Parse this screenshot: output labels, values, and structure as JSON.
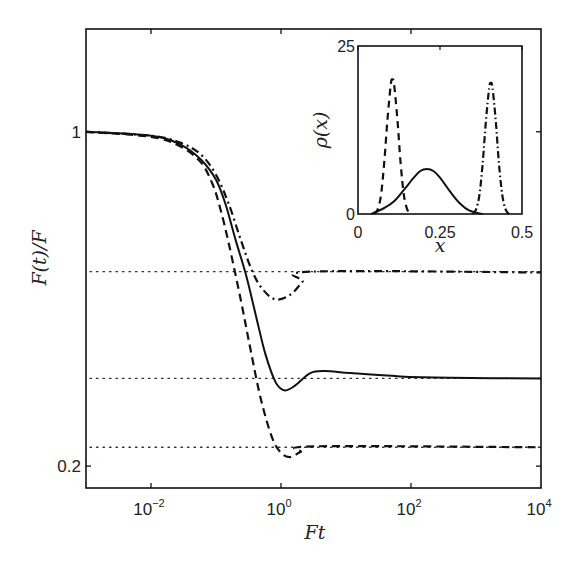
{
  "chart_data": [
    {
      "type": "line",
      "panel": "main",
      "title": "",
      "xlabel": "Ft",
      "ylabel": "F(t)/F",
      "xscale": "log",
      "yscale": "log",
      "xlim_log10": [
        -3,
        4
      ],
      "ylim": [
        0.18,
        1.64
      ],
      "x_ticks": [
        {
          "log10": -2,
          "base": "10",
          "exp": "−2"
        },
        {
          "log10": 0,
          "base": "10",
          "exp": "0"
        },
        {
          "log10": 2,
          "base": "10",
          "exp": "2"
        },
        {
          "log10": 4,
          "base": "10",
          "exp": "4"
        }
      ],
      "y_ticks": [
        {
          "value": 1,
          "label": "1"
        },
        {
          "value": 0.2,
          "label": "0.2"
        }
      ],
      "grid": false,
      "legend": null,
      "reference_lines": [
        {
          "style": "dotted",
          "value": 0.51
        },
        {
          "style": "dotted",
          "value": 0.305
        },
        {
          "style": "dotted",
          "value": 0.219
        }
      ],
      "series": [
        {
          "name": "solid",
          "style": "solid",
          "log10_x": [
            -3.0,
            -2.0,
            -1.54,
            -1.23,
            -1.0,
            -0.85,
            -0.7,
            -0.54,
            -0.39,
            -0.24,
            -0.08,
            0.06,
            0.22,
            0.45,
            0.68,
            1.07,
            1.83,
            2.6,
            4.0
          ],
          "y": [
            1.0,
            0.981,
            0.939,
            0.874,
            0.794,
            0.704,
            0.595,
            0.503,
            0.415,
            0.343,
            0.299,
            0.288,
            0.295,
            0.313,
            0.316,
            0.313,
            0.308,
            0.306,
            0.305
          ]
        },
        {
          "name": "dashed",
          "style": "dashed",
          "log10_x": [
            -3.0,
            -2.0,
            -1.54,
            -1.23,
            -1.05,
            -0.93,
            -0.8,
            -0.62,
            -0.47,
            -0.31,
            -0.13,
            0.02,
            0.15,
            0.3,
            0.53,
            4.0
          ],
          "y": [
            1.0,
            0.976,
            0.93,
            0.862,
            0.775,
            0.688,
            0.581,
            0.446,
            0.351,
            0.276,
            0.228,
            0.212,
            0.209,
            0.214,
            0.22,
            0.219
          ]
        },
        {
          "name": "dash-dot",
          "style": "dashdot",
          "log10_x": [
            -3.0,
            -2.0,
            -1.54,
            -1.23,
            -1.0,
            -0.8,
            -0.62,
            -0.44,
            -0.28,
            -0.08,
            0.15,
            0.33,
            0.48,
            4.0
          ],
          "y": [
            1.0,
            0.981,
            0.948,
            0.895,
            0.813,
            0.704,
            0.595,
            0.51,
            0.468,
            0.446,
            0.457,
            0.486,
            0.51,
            0.508
          ]
        }
      ]
    },
    {
      "type": "line",
      "panel": "inset",
      "title": "",
      "xlabel": "x",
      "ylabel": "ρ(x)",
      "xlim": [
        0,
        0.5
      ],
      "ylim": [
        0,
        25
      ],
      "x_ticks": [
        {
          "value": 0,
          "label": "0"
        },
        {
          "value": 0.25,
          "label": "0.25"
        },
        {
          "value": 0.5,
          "label": "0.5"
        }
      ],
      "y_ticks": [
        {
          "value": 0,
          "label": "0"
        },
        {
          "value": 25,
          "label": "25"
        }
      ],
      "grid": false,
      "series": [
        {
          "name": "dashed",
          "style": "dashed",
          "x": [
            0.05,
            0.06,
            0.07,
            0.08,
            0.09,
            0.1,
            0.105,
            0.11,
            0.12,
            0.13,
            0.14,
            0.15,
            0.16
          ],
          "y": [
            0.0,
            0.7,
            2.8,
            7.6,
            14.1,
            19.3,
            20.0,
            19.3,
            14.1,
            7.6,
            2.8,
            0.7,
            0.0
          ]
        },
        {
          "name": "solid",
          "style": "solid",
          "x": [
            0.04,
            0.08,
            0.11,
            0.14,
            0.17,
            0.19,
            0.21,
            0.23,
            0.25,
            0.28,
            0.31,
            0.34,
            0.38
          ],
          "y": [
            0.0,
            0.9,
            1.9,
            3.6,
            5.4,
            6.4,
            6.7,
            6.4,
            5.4,
            3.4,
            1.6,
            0.5,
            0.0
          ]
        },
        {
          "name": "dash-dot",
          "style": "dashdot",
          "x": [
            0.35,
            0.36,
            0.37,
            0.38,
            0.39,
            0.4,
            0.405,
            0.41,
            0.42,
            0.43,
            0.44,
            0.45,
            0.46
          ],
          "y": [
            0.0,
            0.7,
            2.8,
            7.4,
            13.8,
            18.8,
            19.5,
            18.8,
            13.8,
            7.4,
            2.8,
            0.7,
            0.0
          ]
        }
      ]
    }
  ],
  "labels": {
    "main_xlabel": "Ft",
    "main_ylabel": "F(t)/F",
    "inset_xlabel": "x",
    "inset_ylabel": "ρ(x)"
  }
}
